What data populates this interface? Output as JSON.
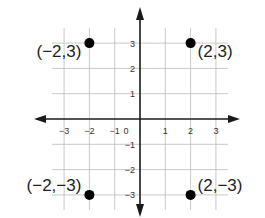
{
  "diagram": {
    "type": "coordinate-plane",
    "x_range": [
      -3,
      3
    ],
    "y_range": [
      -3,
      3
    ],
    "origin_label": "0",
    "x_ticks": [
      {
        "value": -3,
        "label": "−3"
      },
      {
        "value": -2,
        "label": "−2"
      },
      {
        "value": -1,
        "label": "−1"
      },
      {
        "value": 1,
        "label": "1"
      },
      {
        "value": 2,
        "label": "2"
      },
      {
        "value": 3,
        "label": "3"
      }
    ],
    "y_ticks": [
      {
        "value": 3,
        "label": "3"
      },
      {
        "value": 2,
        "label": "2"
      },
      {
        "value": 1,
        "label": "1"
      },
      {
        "value": -1,
        "label": "−1"
      },
      {
        "value": -2,
        "label": "−2"
      },
      {
        "value": -3,
        "label": "−3"
      }
    ],
    "points": [
      {
        "x": -2,
        "y": 3,
        "label": "(−2,3)"
      },
      {
        "x": 2,
        "y": 3,
        "label": "(2,3)"
      },
      {
        "x": -2,
        "y": -3,
        "label": "(−2,−3)"
      },
      {
        "x": 2,
        "y": -3,
        "label": "(2,−3)"
      }
    ],
    "colors": {
      "axis": "#1a1a1a",
      "grid": "#bbbbbb",
      "point": "#000000",
      "text": "#222222"
    }
  }
}
